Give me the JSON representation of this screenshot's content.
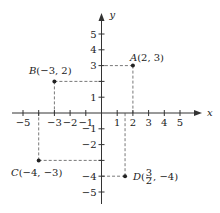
{
  "diagram": {
    "type": "coordinate-plane",
    "axes": {
      "x_label": "x",
      "y_label": "y",
      "x_ticks": [
        -5,
        -4,
        -3,
        -2,
        -1,
        1,
        2,
        3,
        4,
        5
      ],
      "y_ticks": [
        -5,
        -4,
        -3,
        -2,
        -1,
        1,
        2,
        3,
        4,
        5
      ],
      "x_tick_labels": [
        "-5",
        "-3",
        "-2",
        "-1",
        "1",
        "2",
        "3",
        "4",
        "5"
      ],
      "y_tick_labels": [
        "5",
        "4",
        "3",
        "1",
        "-1",
        "-2",
        "-4",
        "-5"
      ]
    },
    "points": [
      {
        "name": "A",
        "x": 2,
        "y": 3,
        "label": "A(2, 3)"
      },
      {
        "name": "B",
        "x": -3,
        "y": 2,
        "label": "B(−3, 2)"
      },
      {
        "name": "C",
        "x": -4,
        "y": -3,
        "label": "C(−4, −3)"
      },
      {
        "name": "D",
        "x": 1.5,
        "y": -4,
        "label": "D(3/2, −4)"
      }
    ],
    "colors": {
      "axis": "#333333",
      "guide": "#555555",
      "point": "#222222"
    }
  }
}
